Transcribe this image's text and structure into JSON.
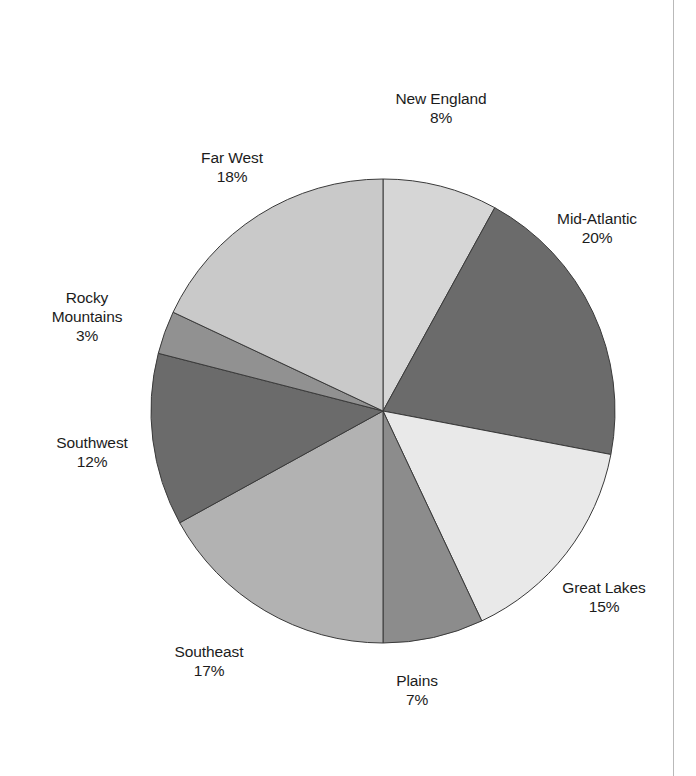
{
  "chart_data": {
    "type": "pie",
    "title": "",
    "subtitle": "",
    "xlabel": "",
    "ylabel": "",
    "legend_position": "none",
    "grid": false,
    "units": "percent",
    "start_angle_deg": 0,
    "direction": "clockwise",
    "categories": [
      "New England",
      "Mid-Atlantic",
      "Great Lakes",
      "Plains",
      "Southeast",
      "Southwest",
      "Rocky Mountains",
      "Far West"
    ],
    "values": [
      8,
      20,
      15,
      7,
      17,
      12,
      3,
      18
    ],
    "value_labels": [
      "8%",
      "20%",
      "15%",
      "7%",
      "17%",
      "12%",
      "3%",
      "18%"
    ],
    "colors": [
      "#d6d6d6",
      "#6b6b6b",
      "#e9e9e9",
      "#8c8c8c",
      "#b2b2b2",
      "#6b6b6b",
      "#919191",
      "#c9c9c9"
    ],
    "slices": [
      {
        "name": "New England",
        "value": 8,
        "label": "New England",
        "value_label": "8%",
        "color": "#d6d6d6",
        "label_x": 441,
        "label_y": 108
      },
      {
        "name": "Mid-Atlantic",
        "value": 20,
        "label": "Mid-Atlantic",
        "value_label": "20%",
        "color": "#6b6b6b",
        "label_x": 597,
        "label_y": 228
      },
      {
        "name": "Great Lakes",
        "value": 15,
        "label": "Great Lakes",
        "value_label": "15%",
        "color": "#e9e9e9",
        "label_x": 604,
        "label_y": 597
      },
      {
        "name": "Plains",
        "value": 7,
        "label": "Plains",
        "value_label": "7%",
        "color": "#8c8c8c",
        "label_x": 417,
        "label_y": 690
      },
      {
        "name": "Southeast",
        "value": 17,
        "label": "Southeast",
        "value_label": "17%",
        "color": "#b2b2b2",
        "label_x": 209,
        "label_y": 661
      },
      {
        "name": "Southwest",
        "value": 12,
        "label": "Southwest",
        "value_label": "12%",
        "color": "#6b6b6b",
        "label_x": 92,
        "label_y": 452
      },
      {
        "name": "Rocky Mountains",
        "value": 3,
        "label": "Rocky\nMountains",
        "value_label": "3%",
        "color": "#919191",
        "label_x": 87,
        "label_y": 316
      },
      {
        "name": "Far West",
        "value": 18,
        "label": "Far West",
        "value_label": "18%",
        "color": "#c9c9c9",
        "label_x": 232,
        "label_y": 167
      }
    ],
    "geometry": {
      "center_x": 383,
      "center_y": 411,
      "radius": 232,
      "stroke": "#3a3a3a",
      "stroke_width": 1
    },
    "background": "#ffffff"
  }
}
